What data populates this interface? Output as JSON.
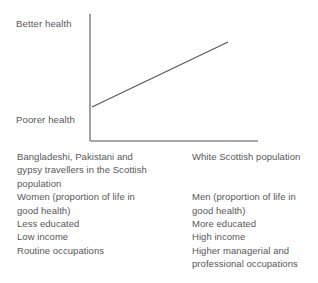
{
  "chart_data": {
    "type": "line",
    "title": "",
    "xlabel": "",
    "ylabel": "Health",
    "grid": false,
    "legend_position": "none",
    "y_tick_labels": [
      "Better health",
      "Poorer health"
    ],
    "x_tick_labels": [],
    "annotations": [],
    "series": [
      {
        "name": "Health gradient",
        "x": [
          0,
          1
        ],
        "y": [
          0.27,
          0.78
        ],
        "points": [
          {
            "x_px": 92,
            "y_px": 107,
            "meaning": "Poorer health / lower socio-economic position"
          },
          {
            "x_px": 228,
            "y_px": 42,
            "meaning": "Better health / higher socio-economic position"
          }
        ]
      }
    ],
    "axis": {
      "y_axis_x_px": 90,
      "y_axis_top_px": 14,
      "y_axis_bottom_px": 141,
      "x_axis_y_px": 141,
      "x_axis_left_px": 90,
      "x_axis_right_px": 258
    },
    "colors": {
      "axis": "#8a8a8a",
      "line": "#555555",
      "text": "#575757",
      "background": "#ffffff"
    }
  },
  "chart": {
    "y_axis_top_label": "Better health",
    "y_axis_bottom_label": "Poorer health"
  },
  "columns": {
    "left": {
      "lines": [
        "Bangladeshi, Pakistani and",
        "gypsy travellers in the Scottish",
        "population",
        "Women (proportion of life in",
        "good health)",
        "Less educated",
        "Low income",
        "Routine occupations"
      ]
    },
    "right": {
      "lines": [
        "White Scottish population",
        "",
        "",
        "Men (proportion of life in",
        "good health)",
        "More educated",
        "High income",
        "Higher managerial and",
        "professional occupations"
      ]
    }
  }
}
